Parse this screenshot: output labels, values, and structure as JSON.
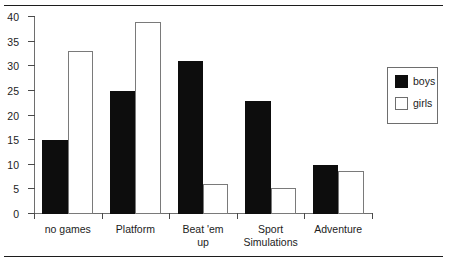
{
  "chart_data": {
    "type": "bar",
    "title": "",
    "subtitle": "",
    "xlabel": "",
    "ylabel": "",
    "ylim": [
      0,
      40
    ],
    "yticks": [
      0,
      5,
      10,
      15,
      20,
      25,
      30,
      35,
      40
    ],
    "ytick_labels": [
      "0",
      "5",
      "10",
      "15",
      "20",
      "25",
      "30",
      "35",
      "40"
    ],
    "grid": false,
    "legend_position": "top-right",
    "categories": [
      "no games",
      "Platform",
      "Beat 'em\nup",
      "Sport\nSimulations",
      "Adventure"
    ],
    "series": [
      {
        "name": "boys",
        "color": "#0d0d0d",
        "values": [
          15,
          25,
          31,
          23,
          10
        ]
      },
      {
        "name": "girls",
        "color": "#ffffff",
        "values": [
          33,
          39,
          6,
          5.2,
          8.7
        ]
      }
    ]
  },
  "legend": {
    "entries": [
      {
        "label": "boys"
      },
      {
        "label": "girls"
      }
    ]
  }
}
